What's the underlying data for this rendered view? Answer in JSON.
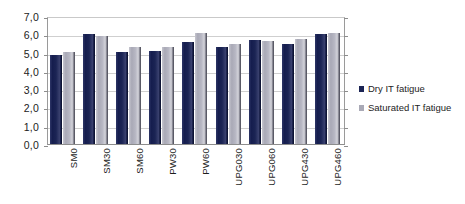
{
  "chart_data": {
    "type": "bar",
    "title": "",
    "xlabel": "",
    "ylabel": "",
    "ylim": [
      0,
      7
    ],
    "ytick_step": 1,
    "grid": true,
    "legend_position": "right",
    "decimal_separator": ",",
    "categories": [
      "SM0",
      "SM30",
      "SM60",
      "PW30",
      "PW60",
      "UPG030",
      "UPG060",
      "UPG430",
      "UPG460"
    ],
    "ytick_labels": [
      "7,0",
      "6,0",
      "5,0",
      "4,0",
      "3,0",
      "2,0",
      "1,0",
      "0,0"
    ],
    "ytick_values": [
      7,
      6,
      5,
      4,
      3,
      2,
      1,
      0
    ],
    "series": [
      {
        "name": "Dry IT fatigue",
        "color": "#1b2454",
        "values": [
          4.85,
          6.0,
          5.05,
          5.1,
          5.6,
          5.3,
          5.7,
          5.45,
          6.0
        ]
      },
      {
        "name": "Saturated IT fatigue",
        "color": "#a9a9b6",
        "values": [
          5.05,
          5.9,
          5.28,
          5.28,
          6.05,
          5.45,
          5.65,
          5.75,
          6.05
        ]
      }
    ]
  },
  "legend": {
    "items": [
      {
        "label": "Dry IT fatigue",
        "swatch": "dry"
      },
      {
        "label": "Saturated IT fatigue",
        "swatch": "sat"
      }
    ]
  }
}
